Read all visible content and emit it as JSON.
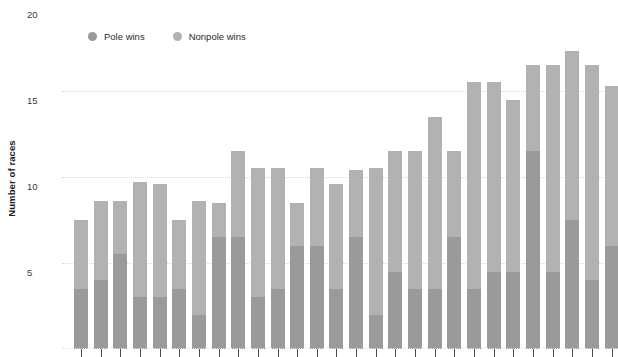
{
  "chart_data": {
    "type": "bar",
    "title": "",
    "xlabel": "",
    "ylabel": "Number of races",
    "ylim": [
      0,
      20
    ],
    "yticks": [
      5,
      10,
      15,
      20
    ],
    "ytick_labels": [
      "5",
      "10",
      "15",
      "20"
    ],
    "grid": true,
    "stacked": true,
    "legend_position": "top",
    "legend": [
      "Pole wins",
      "Nonpole wins"
    ],
    "colors": {
      "pole": "#9a9a9a",
      "nonpole": "#b2b2b2",
      "gridline": "#d8d8d8",
      "text": "#2b2b2b",
      "tick": "#4a4a4a",
      "background": "#ffffff"
    },
    "categories": [
      "1",
      "2",
      "3",
      "4",
      "5",
      "6",
      "7",
      "8",
      "9",
      "10",
      "11",
      "12",
      "13",
      "14",
      "15",
      "16",
      "17",
      "18",
      "19",
      "20",
      "21",
      "22",
      "23",
      "24",
      "25",
      "26",
      "27",
      "28"
    ],
    "series": [
      {
        "name": "Pole wins",
        "values": [
          3.5,
          4.0,
          5.5,
          3.0,
          3.0,
          3.5,
          2.0,
          6.5,
          6.5,
          3.0,
          3.5,
          6.0,
          6.0,
          3.5,
          6.5,
          2.0,
          4.5,
          3.5,
          3.5,
          6.5,
          3.5,
          4.5,
          4.5,
          11.5,
          4.5,
          7.5,
          4.0,
          6.0
        ]
      },
      {
        "name": "Nonpole wins",
        "values": [
          4.0,
          4.6,
          3.1,
          6.7,
          6.6,
          4.0,
          6.6,
          2.0,
          5.0,
          7.5,
          7.0,
          2.5,
          4.5,
          6.1,
          3.9,
          8.5,
          7.0,
          8.0,
          10.0,
          5.0,
          12.0,
          11.0,
          10.0,
          5.0,
          12.0,
          9.8,
          12.5,
          9.3
        ]
      }
    ],
    "totals": [
      7.5,
      8.6,
      8.6,
      9.7,
      9.6,
      7.5,
      8.6,
      8.5,
      11.5,
      10.5,
      10.5,
      8.5,
      10.5,
      9.6,
      10.4,
      10.5,
      11.5,
      11.5,
      13.5,
      11.5,
      15.5,
      15.5,
      14.5,
      16.5,
      16.5,
      17.3,
      16.5,
      15.3
    ]
  },
  "axis": {
    "y_title": "Number of races"
  },
  "legend": {
    "items": [
      {
        "label": "Pole wins",
        "color": "#9a9a9a"
      },
      {
        "label": "Nonpole wins",
        "color": "#b2b2b2"
      }
    ]
  }
}
